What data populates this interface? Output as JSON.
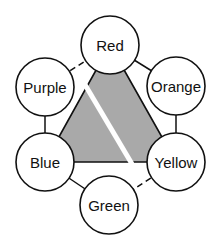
{
  "diagram": {
    "title": "",
    "nodes": [
      {
        "id": "red",
        "label": "Red"
      },
      {
        "id": "orange",
        "label": "Orange"
      },
      {
        "id": "yellow",
        "label": "Yellow"
      },
      {
        "id": "green",
        "label": "Green"
      },
      {
        "id": "blue",
        "label": "Blue"
      },
      {
        "id": "purple",
        "label": "Purple"
      }
    ],
    "edges": [
      {
        "from": "red",
        "to": "orange",
        "style": "solid"
      },
      {
        "from": "orange",
        "to": "yellow",
        "style": "solid"
      },
      {
        "from": "yellow",
        "to": "green",
        "style": "dashed"
      },
      {
        "from": "green",
        "to": "blue",
        "style": "solid"
      },
      {
        "from": "blue",
        "to": "purple",
        "style": "solid"
      },
      {
        "from": "purple",
        "to": "red",
        "style": "dashed"
      }
    ],
    "triangle": {
      "vertices": [
        "red",
        "yellow",
        "blue"
      ],
      "fill_color": "#a9a9a9",
      "divided_by_white_gap": true
    },
    "colors": {
      "stroke": "#111111",
      "node_fill": "#ffffff",
      "background": "#ffffff"
    }
  }
}
